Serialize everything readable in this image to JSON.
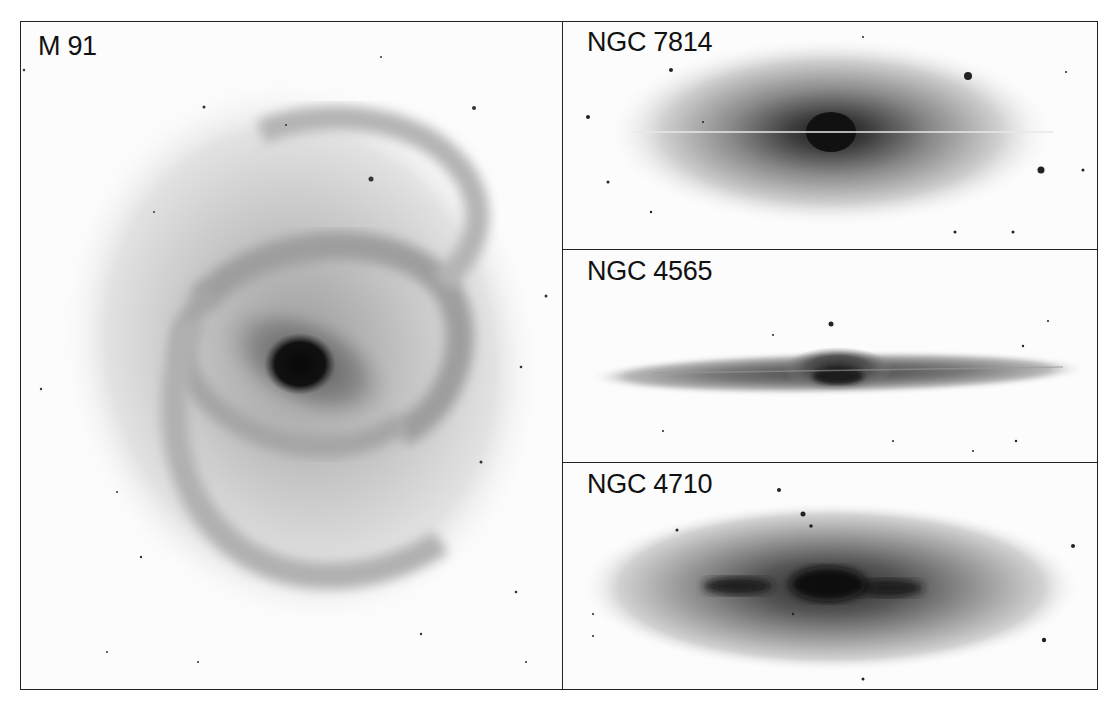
{
  "figure": {
    "panels": [
      {
        "id": "m91",
        "label": "M 91",
        "type": "barred spiral galaxy, face-on"
      },
      {
        "id": "ngc7814",
        "label": "NGC 7814",
        "type": "edge-on spiral with bright bulge and thin dust lane"
      },
      {
        "id": "ngc4565",
        "label": "NGC 4565",
        "type": "edge-on thin disk spiral"
      },
      {
        "id": "ngc4710",
        "label": "NGC 4710",
        "type": "edge-on lenticular with X-shaped dust"
      }
    ],
    "colors": {
      "border": "#222222",
      "background": "#ffffff",
      "ink": "#111111"
    }
  }
}
